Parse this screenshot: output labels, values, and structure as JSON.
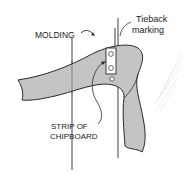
{
  "diagram": {
    "labels": {
      "molding": "MOLDING",
      "tieback_line1": "Tieback",
      "tieback_line2": "marking",
      "strip_line1": "STRIP OF",
      "strip_line2": "CHIPBOARD"
    },
    "colors": {
      "fabric_fill": "#c4c4c4",
      "outline": "#2a2a2a",
      "text": "#1a1a1a",
      "hatch": "#cfcfcf"
    },
    "components": [
      "molding",
      "tieback-marking",
      "tieback-fabric",
      "chipboard-strip",
      "screws",
      "wall-hatching"
    ]
  }
}
